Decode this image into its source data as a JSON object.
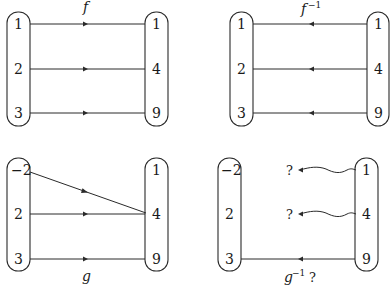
{
  "panels": {
    "f": {
      "label": "f",
      "domain": [
        "1",
        "2",
        "3"
      ],
      "codomain": [
        "1",
        "4",
        "9"
      ],
      "mappings": [
        [
          "1",
          "1"
        ],
        [
          "2",
          "4"
        ],
        [
          "3",
          "9"
        ]
      ],
      "direction": "left-to-right"
    },
    "f_inverse": {
      "label": "f",
      "label_sup": "−1",
      "domain": [
        "1",
        "2",
        "3"
      ],
      "codomain": [
        "1",
        "4",
        "9"
      ],
      "mappings": [
        [
          "1",
          "1"
        ],
        [
          "4",
          "2"
        ],
        [
          "9",
          "3"
        ]
      ],
      "direction": "right-to-left"
    },
    "g": {
      "label": "g",
      "domain": [
        "−2",
        "2",
        "3"
      ],
      "codomain": [
        "1",
        "4",
        "9"
      ],
      "mappings": [
        [
          "−2",
          "4"
        ],
        [
          "2",
          "4"
        ],
        [
          "3",
          "9"
        ]
      ],
      "direction": "left-to-right"
    },
    "g_inverse": {
      "label": "g",
      "label_sup": "−1",
      "label_suffix": "?",
      "domain": [
        "−2",
        "2",
        "3"
      ],
      "codomain": [
        "1",
        "4",
        "9"
      ],
      "unknown_targets": [
        "?",
        "?"
      ],
      "mappings": [
        [
          "1",
          "?"
        ],
        [
          "4",
          "?"
        ],
        [
          "9",
          "3"
        ]
      ],
      "direction": "right-to-left"
    }
  },
  "colors": {
    "ink": "#2a2a2a",
    "background": "#ffffff"
  }
}
